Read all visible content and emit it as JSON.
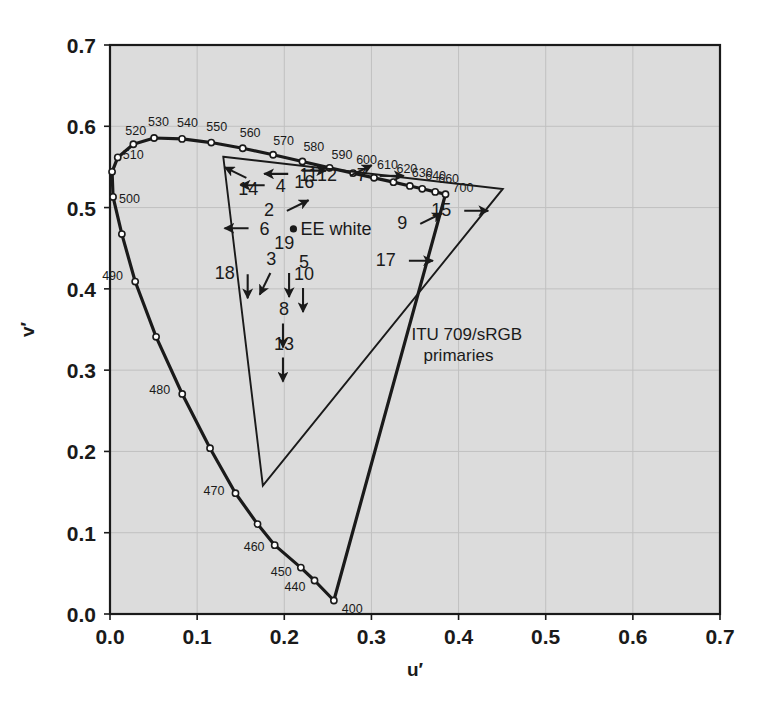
{
  "figure": {
    "kind": "cie-1976-ucs-chromaticity-diagram",
    "background_color": "#ffffff",
    "plot_background_color": "#dcdcdc",
    "line_color": "#1a1a1a",
    "gridline_color": "#c0c0c0"
  },
  "chart_data": {
    "type": "scatter",
    "title": "",
    "xlabel": "u′",
    "ylabel": "v′",
    "xlim": [
      0.0,
      0.7
    ],
    "ylim": [
      0.0,
      0.7
    ],
    "grid": true,
    "xticks": [
      "0.0",
      "0.1",
      "0.2",
      "0.3",
      "0.4",
      "0.5",
      "0.6",
      "0.7"
    ],
    "yticks": [
      "0.0",
      "0.1",
      "0.2",
      "0.3",
      "0.4",
      "0.5",
      "0.6",
      "0.7"
    ],
    "xtick_values": [
      0.0,
      0.1,
      0.2,
      0.3,
      0.4,
      0.5,
      0.6,
      0.7
    ],
    "ytick_values": [
      0.0,
      0.1,
      0.2,
      0.3,
      0.4,
      0.5,
      0.6,
      0.7
    ],
    "series": [
      {
        "name": "spectral locus",
        "marker": "open-circle",
        "points": [
          {
            "u": 0.2569,
            "v": 0.0166,
            "wavelength": 400,
            "label": "400",
            "label_dx": 8,
            "label_dy": 12
          },
          {
            "u": 0.2347,
            "v": 0.0412,
            "wavelength": 440,
            "label": "440",
            "label_dx": -30,
            "label_dy": 10
          },
          {
            "u": 0.219,
            "v": 0.0571,
            "wavelength": 450,
            "label": "450",
            "label_dx": -30,
            "label_dy": 8
          },
          {
            "u": 0.189,
            "v": 0.0847,
            "wavelength": 460,
            "label": "460",
            "label_dx": -31,
            "label_dy": 6
          },
          {
            "u": 0.1693,
            "v": 0.1106,
            "wavelength": 465,
            "label": "",
            "label_dx": 0,
            "label_dy": 0
          },
          {
            "u": 0.144,
            "v": 0.1486,
            "wavelength": 470,
            "label": "470",
            "label_dx": -32,
            "label_dy": 2
          },
          {
            "u": 0.1148,
            "v": 0.204,
            "wavelength": 475,
            "label": "",
            "label_dx": 0,
            "label_dy": 0
          },
          {
            "u": 0.0829,
            "v": 0.2707,
            "wavelength": 480,
            "label": "480",
            "label_dx": -33,
            "label_dy": 0
          },
          {
            "u": 0.0529,
            "v": 0.341,
            "wavelength": 485,
            "label": "",
            "label_dx": 0,
            "label_dy": 0
          },
          {
            "u": 0.0289,
            "v": 0.409,
            "wavelength": 490,
            "label": "490",
            "label_dx": -33,
            "label_dy": -2
          },
          {
            "u": 0.0136,
            "v": 0.4674,
            "wavelength": 495,
            "label": "",
            "label_dx": 0,
            "label_dy": 0
          },
          {
            "u": 0.0035,
            "v": 0.5131,
            "wavelength": 500,
            "label": "500",
            "label_dx": 6,
            "label_dy": 6
          },
          {
            "u": 0.0024,
            "v": 0.544,
            "wavelength": 505,
            "label": "",
            "label_dx": 0,
            "label_dy": 0
          },
          {
            "u": 0.0089,
            "v": 0.5617,
            "wavelength": 510,
            "label": "510",
            "label_dx": 5,
            "label_dy": 2
          },
          {
            "u": 0.0268,
            "v": 0.5779,
            "wavelength": 520,
            "label": "520",
            "label_dx": -8,
            "label_dy": -9
          },
          {
            "u": 0.0506,
            "v": 0.5856,
            "wavelength": 530,
            "label": "530",
            "label_dx": -6,
            "label_dy": -12
          },
          {
            "u": 0.0827,
            "v": 0.5845,
            "wavelength": 540,
            "label": "540",
            "label_dx": -5,
            "label_dy": -12
          },
          {
            "u": 0.1162,
            "v": 0.58,
            "wavelength": 550,
            "label": "550",
            "label_dx": -5,
            "label_dy": -12
          },
          {
            "u": 0.1523,
            "v": 0.573,
            "wavelength": 560,
            "label": "560",
            "label_dx": -3,
            "label_dy": -11
          },
          {
            "u": 0.1872,
            "v": 0.565,
            "wavelength": 570,
            "label": "570",
            "label_dx": 0,
            "label_dy": -10
          },
          {
            "u": 0.2208,
            "v": 0.5567,
            "wavelength": 580,
            "label": "580",
            "label_dx": 1,
            "label_dy": -10
          },
          {
            "u": 0.252,
            "v": 0.5489,
            "wavelength": 590,
            "label": "590",
            "label_dx": 2,
            "label_dy": -9
          },
          {
            "u": 0.279,
            "v": 0.5424,
            "wavelength": 600,
            "label": "600",
            "label_dx": 3,
            "label_dy": -9
          },
          {
            "u": 0.303,
            "v": 0.5366,
            "wavelength": 610,
            "label": "610",
            "label_dx": 3,
            "label_dy": -9
          },
          {
            "u": 0.3253,
            "v": 0.5313,
            "wavelength": 620,
            "label": "620",
            "label_dx": 3,
            "label_dy": -9
          },
          {
            "u": 0.3441,
            "v": 0.5266,
            "wavelength": 630,
            "label": "630",
            "label_dx": 2,
            "label_dy": -9
          },
          {
            "u": 0.3583,
            "v": 0.5231,
            "wavelength": 640,
            "label": "640",
            "label_dx": 3,
            "label_dy": -9
          },
          {
            "u": 0.3732,
            "v": 0.5193,
            "wavelength": 660,
            "label": "660",
            "label_dx": 3,
            "label_dy": -9
          },
          {
            "u": 0.385,
            "v": 0.5164,
            "wavelength": 700,
            "label": "700",
            "label_dx": 7,
            "label_dy": -2
          }
        ]
      }
    ],
    "purple_line": {
      "name": "line of purples",
      "from": {
        "u": 0.385,
        "v": 0.5164
      },
      "to": {
        "u": 0.2569,
        "v": 0.0166
      }
    },
    "gamut_triangle": {
      "name": "ITU 709/sRGB primaries",
      "label_line1": "ITU 709/sRGB",
      "label_line2": "primaries",
      "label_u": 0.346,
      "label_v": 0.337,
      "vertices": [
        {
          "name": "green",
          "u": 0.13,
          "v": 0.5625
        },
        {
          "name": "red",
          "u": 0.4507,
          "v": 0.5229
        },
        {
          "name": "blue",
          "u": 0.1754,
          "v": 0.1579
        }
      ]
    },
    "white_point": {
      "label": "EE white",
      "u": 0.2105,
      "v": 0.4737,
      "marker": "filled-circle"
    },
    "annotations": [
      {
        "id": "2",
        "label": "2",
        "u": 0.203,
        "v": 0.496,
        "dir": "upright",
        "label_side": "left"
      },
      {
        "id": "3",
        "label": "3",
        "u": 0.184,
        "v": 0.4195,
        "dir": "downleft",
        "label_side": "above"
      },
      {
        "id": "4",
        "label": "4",
        "u": 0.1775,
        "v": 0.5275,
        "dir": "left",
        "label_side": "right"
      },
      {
        "id": "5",
        "label": "5",
        "u": 0.2055,
        "v": 0.4195,
        "dir": "down",
        "label_side": "aboveright"
      },
      {
        "id": "6",
        "label": "6",
        "u": 0.159,
        "v": 0.4745,
        "dir": "left",
        "label_side": "right"
      },
      {
        "id": "7",
        "label": "7",
        "u": 0.3095,
        "v": 0.539,
        "dir": "right",
        "label_side": "left"
      },
      {
        "id": "8",
        "label": "8",
        "u": 0.1985,
        "v": 0.3575,
        "dir": "down",
        "label_side": "above"
      },
      {
        "id": "9",
        "label": "9",
        "u": 0.356,
        "v": 0.48,
        "dir": "upright",
        "label_side": "left"
      },
      {
        "id": "10",
        "label": "10",
        "u": 0.2215,
        "v": 0.401,
        "dir": "down",
        "label_side": "above"
      },
      {
        "id": "11",
        "label": "11",
        "u": 0.2045,
        "v": 0.5415,
        "dir": "left",
        "label_side": "right"
      },
      {
        "id": "12",
        "label": "12",
        "u": 0.2755,
        "v": 0.539,
        "dir": "upright",
        "label_side": "left"
      },
      {
        "id": "13",
        "label": "13",
        "u": 0.1985,
        "v": 0.3155,
        "dir": "down",
        "label_side": "above"
      },
      {
        "id": "14",
        "label": "14",
        "u": 0.1565,
        "v": 0.5365,
        "dir": "upleft",
        "label_side": "below"
      },
      {
        "id": "15",
        "label": "15",
        "u": 0.4065,
        "v": 0.496,
        "dir": "right",
        "label_side": "left"
      },
      {
        "id": "16",
        "label": "16",
        "u": 0.2205,
        "v": 0.5455,
        "dir": "right",
        "label_side": "below"
      },
      {
        "id": "17",
        "label": "17",
        "u": 0.343,
        "v": 0.4345,
        "dir": "right",
        "label_side": "left"
      },
      {
        "id": "18",
        "label": "18",
        "u": 0.158,
        "v": 0.418,
        "dir": "down",
        "label_side": "left"
      },
      {
        "id": "19",
        "label": "19",
        "u": 0.2,
        "v": 0.456,
        "dir": "none",
        "label_side": "center"
      }
    ]
  }
}
